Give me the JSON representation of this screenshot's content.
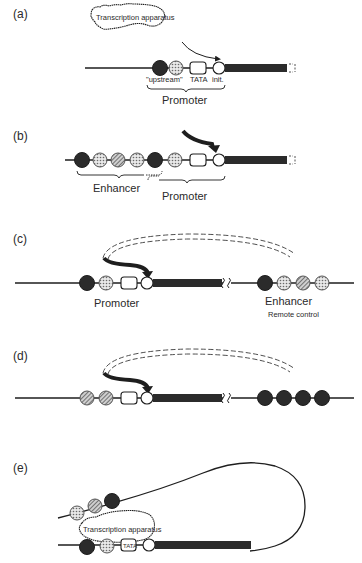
{
  "panels": {
    "a": {
      "label": "(a)",
      "apparatus": "Transcription apparatus",
      "element_labels": {
        "upstream": "\"upstream\"",
        "tata": "TATA",
        "init": "init."
      },
      "promoter": "Promoter"
    },
    "b": {
      "label": "(b)",
      "enhancer": "Enhancer",
      "promoter": "Promoter"
    },
    "c": {
      "label": "(c)",
      "promoter": "Promoter",
      "enhancer": "Enhancer",
      "remote": "Remote control"
    },
    "d": {
      "label": "(d)"
    },
    "e": {
      "label": "(e)",
      "apparatus": "Transcription apparatus",
      "tata": "TATA"
    }
  },
  "colors": {
    "ink": "#1e1e1e",
    "dark_element": "#2b2b2b",
    "background": "#ffffff"
  }
}
